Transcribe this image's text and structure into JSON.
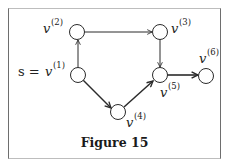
{
  "figure": {
    "caption": "Figure 15",
    "source_label_prefix": "s =",
    "nodes": [
      {
        "id": "v1",
        "label": "v",
        "sup": "(1)",
        "x": 78,
        "y": 75,
        "is_source": true
      },
      {
        "id": "v2",
        "label": "v",
        "sup": "(2)",
        "x": 77,
        "y": 32
      },
      {
        "id": "v3",
        "label": "v",
        "sup": "(3)",
        "x": 160,
        "y": 32
      },
      {
        "id": "v4",
        "label": "v",
        "sup": "(4)",
        "x": 118,
        "y": 112
      },
      {
        "id": "v5",
        "label": "v",
        "sup": "(5)",
        "x": 159,
        "y": 75
      },
      {
        "id": "v6",
        "label": "v",
        "sup": "(6)",
        "x": 206,
        "y": 76
      }
    ],
    "edges": [
      {
        "from": "v1",
        "to": "v2",
        "thick": false
      },
      {
        "from": "v2",
        "to": "v3",
        "thick": false
      },
      {
        "from": "v3",
        "to": "v5",
        "thick": false
      },
      {
        "from": "v1",
        "to": "v4",
        "thick": true
      },
      {
        "from": "v4",
        "to": "v5",
        "thick": true
      },
      {
        "from": "v5",
        "to": "v6",
        "thick": true
      }
    ],
    "colors": {
      "stroke": "#2b2b2b",
      "frame": "#6e6e6e",
      "background": "#ffffff"
    }
  }
}
